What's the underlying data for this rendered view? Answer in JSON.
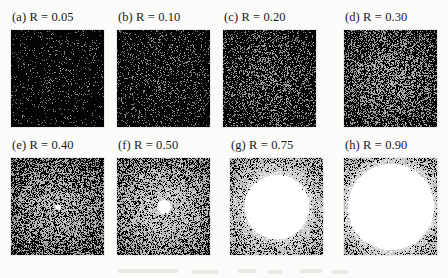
{
  "figure": {
    "background_color": "#fbfbf9",
    "columns": 4,
    "rows": 2,
    "panel_width": 93,
    "panel_height": 97
  },
  "chart_data": {
    "type": "heatmap",
    "title": "",
    "subtitle": "",
    "xlabel": "",
    "ylabel": "",
    "grid": false,
    "legend_position": "none",
    "parameter_name": "R",
    "parameter_values": [
      0.05,
      0.1,
      0.2,
      0.3,
      0.4,
      0.5,
      0.75,
      0.9
    ],
    "panel_letters": [
      "a",
      "b",
      "c",
      "d",
      "e",
      "f",
      "g",
      "h"
    ],
    "panels": [
      {
        "letter": "a",
        "label": "(a) R = 0.05",
        "R": 0.05,
        "center_brightness": 0.1,
        "edge_brightness": 0.02,
        "speckle_density": 0.1,
        "saturated_radius_frac": 0.0
      },
      {
        "letter": "b",
        "label": "(b) R = 0.10",
        "R": 0.1,
        "center_brightness": 0.2,
        "edge_brightness": 0.03,
        "speckle_density": 0.2,
        "saturated_radius_frac": 0.0
      },
      {
        "letter": "c",
        "label": "(c) R = 0.20",
        "R": 0.2,
        "center_brightness": 0.36,
        "edge_brightness": 0.05,
        "speckle_density": 0.36,
        "saturated_radius_frac": 0.0
      },
      {
        "letter": "d",
        "label": "(d) R = 0.30",
        "R": 0.3,
        "center_brightness": 0.52,
        "edge_brightness": 0.07,
        "speckle_density": 0.52,
        "saturated_radius_frac": 0.0
      },
      {
        "letter": "e",
        "label": "(e) R = 0.40",
        "R": 0.4,
        "center_brightness": 0.68,
        "edge_brightness": 0.09,
        "speckle_density": 0.68,
        "saturated_radius_frac": 0.05
      },
      {
        "letter": "f",
        "label": "(f) R = 0.50",
        "R": 0.5,
        "center_brightness": 0.82,
        "edge_brightness": 0.11,
        "speckle_density": 0.82,
        "saturated_radius_frac": 0.12
      },
      {
        "letter": "g",
        "label": "(g) R = 0.75",
        "R": 0.75,
        "center_brightness": 1.0,
        "edge_brightness": 0.16,
        "speckle_density": 1.0,
        "saturated_radius_frac": 0.58
      },
      {
        "letter": "h",
        "label": "(h) R = 0.90",
        "R": 0.9,
        "center_brightness": 1.0,
        "edge_brightness": 0.22,
        "speckle_density": 1.0,
        "saturated_radius_frac": 0.78
      }
    ]
  },
  "layout": {
    "panel_positions": [
      {
        "x": 11,
        "y": 10
      },
      {
        "x": 117,
        "y": 10
      },
      {
        "x": 223,
        "y": 10
      },
      {
        "x": 344,
        "y": 10
      },
      {
        "x": 11,
        "y": 138
      },
      {
        "x": 117,
        "y": 138
      },
      {
        "x": 230,
        "y": 138
      },
      {
        "x": 344,
        "y": 138
      }
    ]
  }
}
